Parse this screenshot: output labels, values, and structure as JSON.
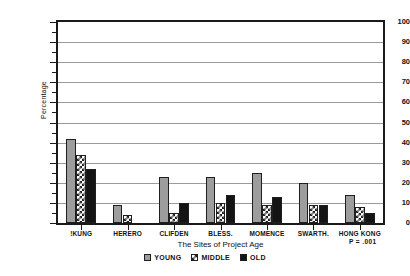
{
  "chart_data": {
    "type": "bar",
    "title": "",
    "xlabel": "The Sites of Project Age",
    "ylabel": "Percentage",
    "ylim": [
      0,
      100
    ],
    "ytick_step": 10,
    "yticks": [
      0,
      10,
      20,
      30,
      40,
      50,
      60,
      70,
      80,
      90,
      100
    ],
    "ytick_labels": [
      "0",
      "10",
      "20",
      "30",
      "40",
      "50",
      "60",
      "70",
      "80",
      "90",
      "100"
    ],
    "grid": true,
    "grid_axis": "y",
    "legend_position": "bottom-center",
    "categories": [
      "!KUNG",
      "HERERO",
      "CLIFDEN",
      "BLESS.",
      "MOMENCE",
      "SWARTH.",
      "HONG KONG"
    ],
    "series": [
      {
        "name": "YOUNG",
        "fill": "solid-gray",
        "color": "#9d9d9d",
        "values": [
          42,
          9,
          23,
          23,
          25,
          20,
          14
        ]
      },
      {
        "name": "MIDDLE",
        "fill": "crosshatch",
        "color": "#ffffff",
        "values": [
          34,
          4,
          5,
          10,
          9,
          9,
          8
        ]
      },
      {
        "name": "OLD",
        "fill": "solid-black",
        "color": "#141414",
        "values": [
          27,
          0,
          10,
          14,
          13,
          9,
          5
        ]
      }
    ],
    "annotations": [
      {
        "name": "p-value",
        "text": "P = .001"
      }
    ]
  },
  "axis": {
    "y_title": "Percentage",
    "x_title": "The Sites of Project Age"
  },
  "legend": {
    "items": [
      {
        "label": "YOUNG",
        "swatch": "solid-gray"
      },
      {
        "label": "MIDDLE",
        "swatch": "crosshatch"
      },
      {
        "label": "OLD",
        "swatch": "solid-black"
      }
    ]
  },
  "footnote": {
    "p_value": "P = .001"
  },
  "colors": {
    "young": "#9d9d9d",
    "middle": "#ffffff",
    "old": "#141414",
    "axis": "#1a1a1a",
    "grid": "#9a9a9a",
    "background": "#ffffff"
  }
}
